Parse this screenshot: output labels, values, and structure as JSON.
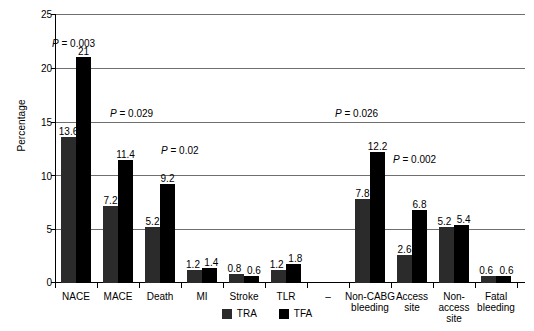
{
  "chart_data": {
    "type": "bar",
    "title": "",
    "xlabel": "",
    "ylabel": "Percentage",
    "ylim": [
      0,
      25
    ],
    "yticks": [
      0,
      5,
      10,
      15,
      20,
      25
    ],
    "grid": true,
    "legend_position": "bottom",
    "categories": [
      "NACE",
      "MACE",
      "Death",
      "MI",
      "Stroke",
      "TLR",
      "",
      "Non-CABG bleeding",
      "Access site",
      "Non-access site",
      "Fatal bleeding"
    ],
    "series": [
      {
        "name": "TRA",
        "color": "#2b2b2b",
        "values": [
          13.6,
          7.2,
          5.2,
          1.2,
          0.8,
          1.2,
          null,
          7.8,
          2.6,
          5.2,
          0.6
        ]
      },
      {
        "name": "TFA",
        "color": "#000000",
        "values": [
          21,
          11.4,
          9.2,
          1.4,
          0.6,
          1.8,
          null,
          12.2,
          6.8,
          5.4,
          0.6
        ]
      }
    ],
    "annotations": [
      {
        "text": "P = 0.003",
        "category": "NACE"
      },
      {
        "text": "P = 0.029",
        "category": "MACE"
      },
      {
        "text": "P = 0.02",
        "category": "Death"
      },
      {
        "text": "P = 0.026",
        "category": "Non-CABG bleeding"
      },
      {
        "text": "P = 0.002",
        "category": "Non-CABG bleeding"
      }
    ]
  },
  "axis": {
    "ylabel": "Percentage",
    "tick_25": "25",
    "tick_20": "20",
    "tick_15": "15",
    "tick_10": "10",
    "tick_5": "5",
    "tick_0": "0"
  },
  "categories": {
    "c0": "NACE",
    "c1": "MACE",
    "c2": "Death",
    "c3": "MI",
    "c4": "Stroke",
    "c5": "TLR",
    "c6": "",
    "c7_line1": "Non-CABG",
    "c7_line2": "bleeding",
    "c8_line1": "Access",
    "c8_line2": "site",
    "c9_line1": "Non-access",
    "c9_line2": "site",
    "c10_line1": "Fatal",
    "c10_line2": "bleeding"
  },
  "values": {
    "nace_tra": "13.6",
    "nace_tfa": "21",
    "mace_tra": "7.2",
    "mace_tfa": "11.4",
    "death_tra": "5.2",
    "death_tfa": "9.2",
    "mi_tra": "1.2",
    "mi_tfa": "1.4",
    "stroke_tra": "0.8",
    "stroke_tfa": "0.6",
    "tlr_tra": "1.2",
    "tlr_tfa": "1.8",
    "noncabg_tra": "7.8",
    "noncabg_tfa": "12.2",
    "access_tra": "2.6",
    "access_tfa": "6.8",
    "nonaccess_tra": "5.2",
    "nonaccess_tfa": "5.4",
    "fatal_tra": "0.6",
    "fatal_tfa": "0.6"
  },
  "pvalues": {
    "p_nace": "P = 0.003",
    "p_mace": "P = 0.029",
    "p_death": "P = 0.02",
    "p_noncabg_top": "P = 0.026",
    "p_noncabg_bar": "P = 0.002"
  },
  "legend": {
    "tra": "TRA",
    "tfa": "TFA"
  }
}
